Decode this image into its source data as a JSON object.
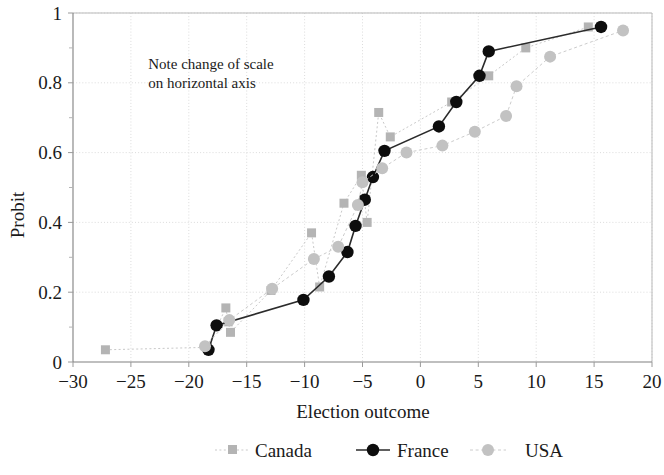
{
  "chart_data": {
    "type": "line",
    "title": "",
    "xlabel": "Election outcome",
    "ylabel": "Probit",
    "xlim": [
      -30,
      20
    ],
    "ylim": [
      0,
      1
    ],
    "xticks": [
      -30,
      -25,
      -20,
      -15,
      -10,
      -5,
      0,
      5,
      10,
      15,
      20
    ],
    "xticklabels": [
      "−30",
      "−25",
      "−20",
      "−15",
      "−10",
      "−5",
      "0",
      "5",
      "10",
      "15",
      "20"
    ],
    "yticks": [
      0,
      0.2,
      0.4,
      0.6,
      0.8,
      1
    ],
    "yticklabels": [
      "0",
      "0.2",
      "0.4",
      "0.6",
      "0.8",
      "1"
    ],
    "y_minor_ticks": [
      0.1,
      0.3,
      0.5,
      0.7,
      0.9
    ],
    "grid": true,
    "grid_style": "dotted",
    "legend_position": "bottom",
    "annotations": [
      {
        "name": "scale-note",
        "lines": [
          "Note change of scale",
          "on horizontal axis"
        ],
        "x": -23.5,
        "y": 0.84
      }
    ],
    "series": [
      {
        "name": "Canada",
        "color": "#b4b4b4",
        "marker": "square",
        "line_style": "dotted",
        "points": [
          [
            -27.2,
            0.035
          ],
          [
            -18.4,
            0.042
          ],
          [
            -16.8,
            0.155
          ],
          [
            -16.6,
            0.115
          ],
          [
            -16.4,
            0.085
          ],
          [
            -12.9,
            0.205
          ],
          [
            -9.4,
            0.37
          ],
          [
            -8.7,
            0.215
          ],
          [
            -6.6,
            0.455
          ],
          [
            -5.1,
            0.535
          ],
          [
            -4.6,
            0.4
          ],
          [
            -3.6,
            0.715
          ],
          [
            -2.6,
            0.645
          ],
          [
            2.7,
            0.745
          ],
          [
            5.9,
            0.82
          ],
          [
            9.1,
            0.9
          ],
          [
            14.5,
            0.96
          ]
        ]
      },
      {
        "name": "France",
        "color": "#0d0d0d",
        "marker": "circle",
        "line_style": "solid",
        "points": [
          [
            -18.3,
            0.035
          ],
          [
            -17.6,
            0.105
          ],
          [
            -10.1,
            0.178
          ],
          [
            -7.9,
            0.245
          ],
          [
            -6.3,
            0.315
          ],
          [
            -5.6,
            0.39
          ],
          [
            -4.8,
            0.465
          ],
          [
            -4.1,
            0.53
          ],
          [
            -3.1,
            0.605
          ],
          [
            1.6,
            0.675
          ],
          [
            3.1,
            0.745
          ],
          [
            5.1,
            0.82
          ],
          [
            5.9,
            0.89
          ],
          [
            15.6,
            0.96
          ]
        ]
      },
      {
        "name": "USA",
        "color": "#c2c2c2",
        "marker": "circle",
        "line_style": "dashed",
        "points": [
          [
            -18.6,
            0.045
          ],
          [
            -16.5,
            0.12
          ],
          [
            -12.8,
            0.21
          ],
          [
            -9.2,
            0.295
          ],
          [
            -7.1,
            0.33
          ],
          [
            -5.4,
            0.45
          ],
          [
            -5.0,
            0.515
          ],
          [
            -3.3,
            0.555
          ],
          [
            -1.2,
            0.6
          ],
          [
            1.9,
            0.62
          ],
          [
            4.7,
            0.66
          ],
          [
            7.4,
            0.705
          ],
          [
            8.3,
            0.79
          ],
          [
            11.2,
            0.875
          ],
          [
            17.5,
            0.95
          ]
        ]
      }
    ]
  },
  "legend": {
    "items": [
      {
        "label": "Canada",
        "key": "canada"
      },
      {
        "label": "France",
        "key": "france"
      },
      {
        "label": "USA",
        "key": "usa"
      }
    ]
  }
}
